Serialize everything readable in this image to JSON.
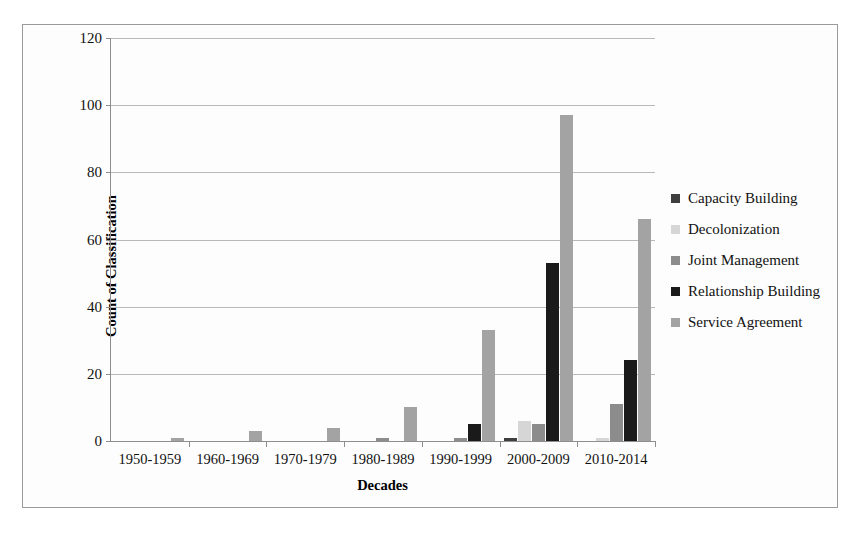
{
  "chart_data": {
    "type": "bar",
    "title": "",
    "xlabel": "Decades",
    "ylabel": "Count of Classification",
    "ylim": [
      0,
      120
    ],
    "ytick_step": 20,
    "yticks": [
      0,
      20,
      40,
      60,
      80,
      100,
      120
    ],
    "grid": "horizontal",
    "legend_position": "right",
    "categories": [
      "1950-1959",
      "1960-1969",
      "1970-1979",
      "1980-1989",
      "1990-1999",
      "2000-2009",
      "2010-2014"
    ],
    "series": [
      {
        "name": "Capacity Building",
        "color": "#3f3f3f",
        "values": [
          0,
          0,
          0,
          0,
          0,
          1,
          0
        ]
      },
      {
        "name": "Decolonization",
        "color": "#d6d6d6",
        "values": [
          0,
          0,
          0,
          0,
          0,
          6,
          1
        ]
      },
      {
        "name": "Joint Management",
        "color": "#8c8c8c",
        "values": [
          0,
          0,
          0,
          1,
          1,
          5,
          11
        ]
      },
      {
        "name": "Relationship Building",
        "color": "#1a1a1a",
        "values": [
          0,
          0,
          0,
          0,
          5,
          53,
          24
        ]
      },
      {
        "name": "Service Agreement",
        "color": "#a3a3a3",
        "values": [
          1,
          3,
          4,
          10,
          33,
          97,
          66
        ]
      }
    ]
  },
  "legend": {
    "items": [
      {
        "label": "Capacity Building"
      },
      {
        "label": "Decolonization"
      },
      {
        "label": "Joint Management"
      },
      {
        "label": "Relationship Building"
      },
      {
        "label": "Service Agreement"
      }
    ]
  }
}
